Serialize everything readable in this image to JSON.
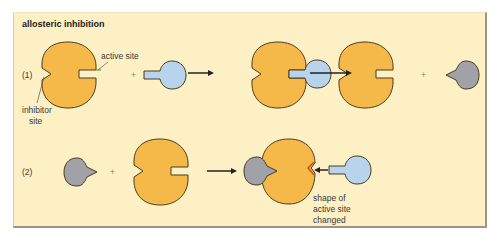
{
  "diagram": {
    "title": "allosteric inhibition",
    "rows": [
      {
        "label": "(1)",
        "steps": [
          "enzyme + substrate",
          "enzyme-substrate complex",
          "enzyme + inhibitor"
        ]
      },
      {
        "label": "(2)",
        "steps": [
          "inhibitor + enzyme",
          "inhibitor bound, active site changed, substrate blocked"
        ]
      }
    ],
    "annotations": {
      "active_site": "active site",
      "inhibitor_site_line1": "inhibitor",
      "inhibitor_site_line2": "site",
      "shape_changed_line1": "shape of",
      "shape_changed_line2": "active site",
      "shape_changed_line3": "changed"
    },
    "operators": {
      "plus": "+"
    },
    "colors": {
      "background": "#fcf0c4",
      "enzyme": "#f5b94a",
      "substrate": "#b8d4ec",
      "inhibitor": "#a0a2a8",
      "outline": "#4a3a20",
      "active_site_highlight": "#7ac142",
      "changed_site": "#c8501c"
    }
  }
}
